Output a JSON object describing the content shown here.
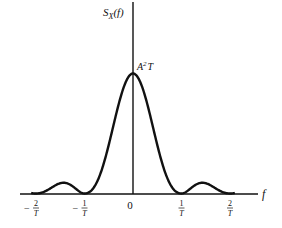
{
  "chart_data": {
    "type": "line",
    "title": "",
    "xlabel": "f",
    "ylabel": "S_X(f)",
    "function": "A^2 T sinc^2(fT)",
    "peak_label": "A²T",
    "peak_value": 1.0,
    "xlim": [
      -2.3,
      2.6
    ],
    "ylim": [
      0,
      1.0
    ],
    "x_ticks": [
      {
        "value": -2,
        "num": "2",
        "den": "T",
        "sign": "−"
      },
      {
        "value": -1,
        "num": "1",
        "den": "T",
        "sign": "−"
      },
      {
        "value": 0,
        "num": "0",
        "den": "",
        "sign": ""
      },
      {
        "value": 1,
        "num": "1",
        "den": "T",
        "sign": ""
      },
      {
        "value": 2,
        "num": "2",
        "den": "T",
        "sign": ""
      }
    ],
    "curve_range": [
      -2.1,
      2.1
    ],
    "grid": false,
    "legend": "none"
  },
  "labels": {
    "y_axis_symbol": "S",
    "y_axis_sub": "X",
    "y_axis_arg": "(f)",
    "x_axis": "f",
    "peak_base": "A",
    "peak_sup": "2",
    "peak_tail": "T"
  }
}
